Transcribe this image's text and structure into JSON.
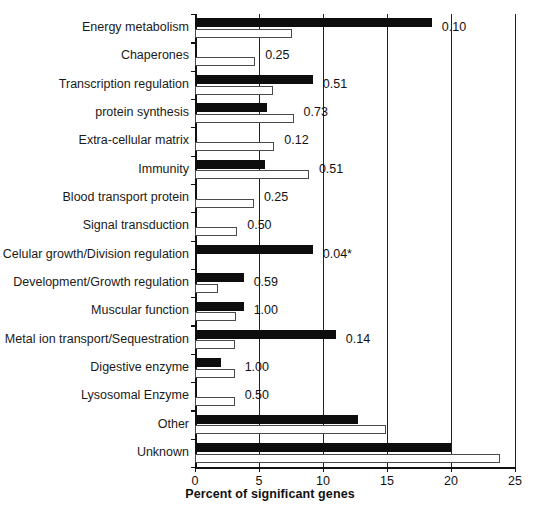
{
  "chart_data": {
    "type": "bar",
    "orientation": "horizontal",
    "title": "",
    "xlabel": "Percent of significant genes",
    "ylabel": "",
    "xlim": [
      0,
      25
    ],
    "xticks": [
      0,
      5,
      10,
      15,
      20,
      25
    ],
    "xtick_labels": [
      "0",
      "5",
      "10",
      "15",
      "20",
      "25"
    ],
    "grid": "vertical",
    "legend": "none",
    "annotation_note": "value shown at right of each category pair is the p-value; * marks significance",
    "categories": [
      "Energy metabolism",
      "Chaperones",
      "Transcription regulation",
      "protein synthesis",
      "Extra-cellular matrix",
      "Immunity",
      "Blood transport protein",
      "Signal transduction",
      "Celular growth/Division regulation",
      "Development/Growth regulation",
      "Muscular function",
      "Metal ion transport/Sequestration",
      "Digestive enzyme",
      "Lysosomal Enzyme",
      "Other",
      "Unknown"
    ],
    "series": [
      {
        "name": "black",
        "values": [
          18.5,
          0.0,
          9.2,
          5.6,
          0.0,
          5.5,
          0.0,
          0.0,
          9.2,
          3.8,
          3.8,
          11.0,
          2.0,
          0.0,
          12.7,
          20.0
        ]
      },
      {
        "name": "white",
        "values": [
          7.6,
          4.7,
          6.1,
          7.7,
          6.2,
          8.9,
          4.6,
          3.3,
          0.0,
          1.8,
          3.2,
          3.1,
          3.1,
          3.1,
          14.9,
          23.8
        ]
      }
    ],
    "pvalues": [
      "0.10",
      "0.25",
      "0.51",
      "0.73",
      "0.12",
      "0.51",
      "0.25",
      "0.50",
      "0.04*",
      "0.59",
      "1.00",
      "0.14",
      "1.00",
      "0.50",
      "",
      ""
    ]
  },
  "colors": {
    "dark_bar": "#0d0d0d",
    "light_bar": "#ffffff",
    "light_bar_edge": "#4a4a4a",
    "axis": "#111111",
    "grid": "#222222",
    "text": "#1a1a1a",
    "background": "#ffffff"
  }
}
